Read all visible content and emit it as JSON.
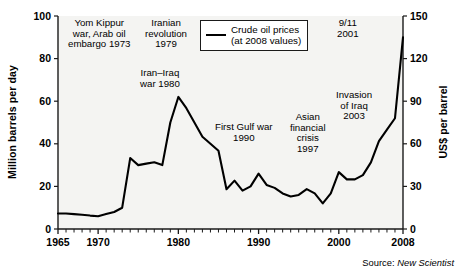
{
  "figure": {
    "source_prefix": "Source:",
    "source_name": "New Scientist"
  },
  "legend": {
    "label": "Crude oil prices\n(at 2008 values)",
    "line_color": "#000000"
  },
  "annotations": [
    {
      "id": "yom-kippur",
      "text": "Yom Kippur\nwar, Arab oil\nembargo 1973",
      "x": 68,
      "y": 18
    },
    {
      "id": "iranian-revolution",
      "text": "Iranian\nrevolution\n1979",
      "x": 145,
      "y": 18
    },
    {
      "id": "iran-iraq-war",
      "text": "Iran–Iraq\nwar 1980",
      "x": 140,
      "y": 68
    },
    {
      "id": "first-gulf-war",
      "text": "First Gulf war\n1990",
      "x": 215,
      "y": 122
    },
    {
      "id": "asian-financial-crisis",
      "text": "Asian\nfinancial\ncrisis\n1997",
      "x": 290,
      "y": 112
    },
    {
      "id": "september-11",
      "text": "9/11\n2001",
      "x": 337,
      "y": 18
    },
    {
      "id": "invasion-of-iraq",
      "text": "Invasion\nof Iraq\n2003",
      "x": 336,
      "y": 90
    }
  ],
  "chart_data": {
    "type": "line",
    "title": "",
    "xlabel": "",
    "ylabel": "Million barrels per day",
    "y2label": "US$ per barrel",
    "grid": false,
    "legend_position": "top-center",
    "xlim": [
      1965,
      2008
    ],
    "ylim": [
      0,
      100
    ],
    "y2lim": [
      0,
      150
    ],
    "xticks": [
      1965,
      1970,
      1980,
      1990,
      2000,
      2008
    ],
    "xtick_labels": [
      "1965",
      "1970",
      "1980",
      "1990",
      "2000",
      "2008"
    ],
    "xminor_step": 1,
    "yticks": [
      0,
      20,
      40,
      60,
      80,
      100
    ],
    "ytick_labels": [
      "0",
      "20",
      "40",
      "60",
      "80",
      "100"
    ],
    "y2ticks": [
      0,
      30,
      60,
      90,
      120,
      150
    ],
    "y2tick_labels": [
      "0",
      "30",
      "60",
      "90",
      "120",
      "150"
    ],
    "series": [
      {
        "name": "Crude oil prices (at 2008 values)",
        "color": "#000000",
        "x": [
          1965,
          1966,
          1967,
          1968,
          1969,
          1970,
          1971,
          1972,
          1973,
          1974,
          1975,
          1976,
          1977,
          1978,
          1979,
          1980,
          1981,
          1982,
          1983,
          1984,
          1985,
          1986,
          1987,
          1988,
          1989,
          1990,
          1991,
          1992,
          1993,
          1994,
          1995,
          1996,
          1997,
          1998,
          1999,
          2000,
          2001,
          2002,
          2003,
          2004,
          2005,
          2006,
          2007,
          2008
        ],
        "values_usd_per_barrel": [
          11,
          11,
          10.5,
          10,
          9.5,
          9,
          10.5,
          12,
          15,
          50,
          45,
          46,
          47,
          45,
          75,
          93,
          85,
          75,
          65,
          60,
          55,
          28,
          34,
          27,
          30,
          39,
          31,
          29,
          25,
          23,
          24,
          28,
          25,
          18,
          25,
          40,
          35,
          35,
          38,
          47,
          62,
          70,
          78,
          135
        ],
        "values_mbpd_scale": [
          7.3,
          7.3,
          7.0,
          6.7,
          6.3,
          6.0,
          7.0,
          8.0,
          10.0,
          33.3,
          30.0,
          30.7,
          31.3,
          30.0,
          50.0,
          62.0,
          56.7,
          50.0,
          43.3,
          40.0,
          36.7,
          18.7,
          22.7,
          18.0,
          20.0,
          26.0,
          20.7,
          19.3,
          16.7,
          15.3,
          16.0,
          18.7,
          16.7,
          12.0,
          16.7,
          26.7,
          23.3,
          23.3,
          25.3,
          31.3,
          41.3,
          46.7,
          52.0,
          90.0
        ]
      }
    ],
    "annotation_labels": [
      "Yom Kippur war, Arab oil embargo 1973",
      "Iranian revolution 1979",
      "Iran–Iraq war 1980",
      "First Gulf war 1990",
      "Asian financial crisis 1997",
      "9/11 2001",
      "Invasion of Iraq 2003"
    ]
  }
}
